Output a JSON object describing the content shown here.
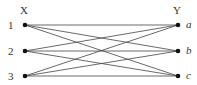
{
  "left_group": {
    "title": "X",
    "nodes": [
      {
        "label": "1",
        "x": 25,
        "y": 25
      },
      {
        "label": "2",
        "x": 25,
        "y": 51
      },
      {
        "label": "3",
        "x": 25,
        "y": 76
      }
    ]
  },
  "right_group": {
    "title": "Y",
    "nodes": [
      {
        "label": "a",
        "x": 178,
        "y": 25
      },
      {
        "label": "b",
        "x": 178,
        "y": 51
      },
      {
        "label": "c",
        "x": 178,
        "y": 76
      }
    ]
  },
  "edges": [
    [
      "1",
      "a"
    ],
    [
      "1",
      "b"
    ],
    [
      "1",
      "c"
    ],
    [
      "2",
      "a"
    ],
    [
      "2",
      "b"
    ],
    [
      "2",
      "c"
    ],
    [
      "3",
      "a"
    ],
    [
      "3",
      "b"
    ],
    [
      "3",
      "c"
    ]
  ],
  "colors": {
    "edge": "#444444",
    "node": "#111111",
    "text": "#333333"
  }
}
